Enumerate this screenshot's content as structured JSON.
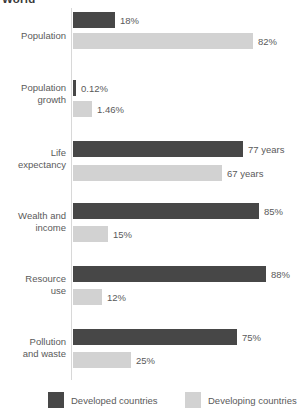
{
  "chart_data": {
    "type": "bar",
    "orientation": "horizontal",
    "title": "World",
    "xlabel": "",
    "ylabel": "",
    "grid": false,
    "legend_position": "bottom",
    "categories": [
      "Population",
      "Population growth",
      "Life expectancy",
      "Wealth and income",
      "Resource use",
      "Pollution and waste"
    ],
    "series": [
      {
        "name": "Developed countries",
        "color": "#474747",
        "values": [
          18,
          0.12,
          77,
          85,
          88,
          75
        ],
        "labels": [
          "18%",
          "0.12%",
          "77 years",
          "85%",
          "88%",
          "75%"
        ]
      },
      {
        "name": "Developing countries",
        "color": "#d2d2d2",
        "values": [
          82,
          1.46,
          67,
          15,
          12,
          25
        ],
        "labels": [
          "82%",
          "1.46%",
          "67 years",
          "15%",
          "12%",
          "25%"
        ]
      }
    ],
    "groups": [
      {
        "label_line1": "Population",
        "label_line2": "",
        "top": 0,
        "label_top": 22,
        "bars": [
          {
            "series": "Developed countries",
            "value": 18,
            "label": "18%",
            "width_px": 42,
            "top": 4
          },
          {
            "series": "Developing countries",
            "value": 82,
            "label": "82%",
            "width_px": 180,
            "top": 25
          }
        ]
      },
      {
        "label_line1": "Population",
        "label_line2": "growth",
        "top": 60,
        "label_top": 14,
        "bars": [
          {
            "series": "Developed countries",
            "value": 0.12,
            "label": "0.12%",
            "width_px": 3,
            "top": 12
          },
          {
            "series": "Developing countries",
            "value": 1.46,
            "label": "1.46%",
            "width_px": 19,
            "top": 33
          }
        ]
      },
      {
        "label_line1": "Life",
        "label_line2": "expectancy",
        "top": 125,
        "label_top": 14,
        "bars": [
          {
            "series": "Developed countries",
            "value": 77,
            "label": "77 years",
            "width_px": 170,
            "top": 8
          },
          {
            "series": "Developing countries",
            "value": 67,
            "label": "67 years",
            "width_px": 149,
            "top": 32
          }
        ]
      },
      {
        "label_line1": "Wealth and",
        "label_line2": "income",
        "top": 190,
        "label_top": 12,
        "bars": [
          {
            "series": "Developed countries",
            "value": 85,
            "label": "85%",
            "width_px": 186,
            "top": 5
          },
          {
            "series": "Developing countries",
            "value": 15,
            "label": "15%",
            "width_px": 35,
            "top": 28
          }
        ]
      },
      {
        "label_line1": "Resource",
        "label_line2": "use",
        "top": 253,
        "label_top": 12,
        "bars": [
          {
            "series": "Developed countries",
            "value": 88,
            "label": "88%",
            "width_px": 193,
            "top": 5
          },
          {
            "series": "Developing countries",
            "value": 12,
            "label": "12%",
            "width_px": 29,
            "top": 28
          }
        ]
      },
      {
        "label_line1": "Pollution",
        "label_line2": "and waste",
        "top": 316,
        "label_top": 12,
        "bars": [
          {
            "series": "Developed countries",
            "value": 75,
            "label": "75%",
            "width_px": 164,
            "top": 5
          },
          {
            "series": "Developing countries",
            "value": 25,
            "label": "25%",
            "width_px": 58,
            "top": 28
          }
        ]
      }
    ],
    "legend": [
      {
        "label": "Developed countries",
        "color": "#474747",
        "left": 48
      },
      {
        "label": "Developing countries",
        "color": "#d2d2d2",
        "left": 185
      }
    ]
  }
}
